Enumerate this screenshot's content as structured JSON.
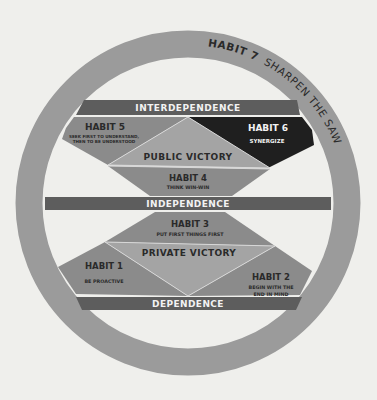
{
  "diagram": {
    "type": "maturity-continuum",
    "colors": {
      "background": "#efefec",
      "ring": "#9b9b9b",
      "band": "#5d5d5d",
      "habit_region": "#8b8b8b",
      "victory_triangle": "#a4a4a4",
      "habit6_region": "#1f1f1f",
      "text_dark": "#2a2a2a",
      "text_light": "#f2f2f2",
      "divider_line": "#d8d8d8"
    },
    "ring": {
      "habit_label": "HABIT 7",
      "habit_name": "SHARPEN THE SAW"
    },
    "bands": {
      "interdependence": "INTERDEPENDENCE",
      "independence": "INDEPENDENCE",
      "dependence": "DEPENDENCE"
    },
    "victories": {
      "public": "PUBLIC VICTORY",
      "private": "PRIVATE VICTORY"
    },
    "habits": {
      "h1": {
        "label": "HABIT 1",
        "lines": [
          "BE PROACTIVE"
        ]
      },
      "h2": {
        "label": "HABIT 2",
        "lines": [
          "BEGIN WITH THE",
          "END IN MIND"
        ]
      },
      "h3": {
        "label": "HABIT 3",
        "lines": [
          "PUT FIRST THINGS FIRST"
        ]
      },
      "h4": {
        "label": "HABIT 4",
        "lines": [
          "THINK WIN-WIN"
        ]
      },
      "h5": {
        "label": "HABIT 5",
        "lines": [
          "SEEK FIRST TO UNDERSTAND,",
          "THEN TO BE UNDERSTOOD"
        ]
      },
      "h6": {
        "label": "HABIT 6",
        "lines": [
          "SYNERGIZE"
        ]
      }
    }
  }
}
